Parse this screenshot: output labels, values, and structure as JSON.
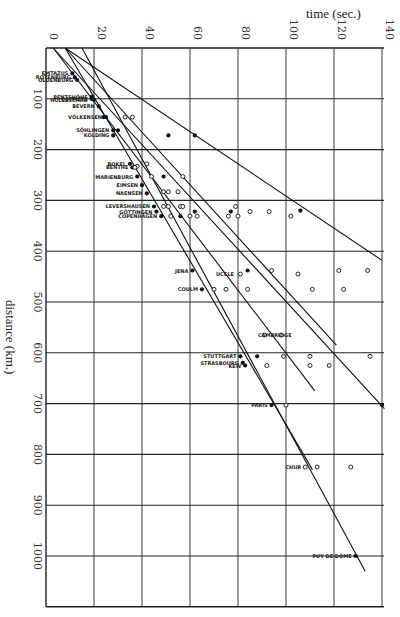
{
  "chart_data": {
    "type": "scatter",
    "title": "time (sec.)",
    "xlabel": "time (sec.)",
    "ylabel": "distance (km.)",
    "xlim": [
      0,
      140
    ],
    "ylim": [
      0,
      1100
    ],
    "x_axis_position": "top",
    "y_axis_inverted": true,
    "grid": true,
    "x_ticks": [
      "0",
      "20",
      "40",
      "60",
      "80",
      "100",
      "120",
      "140"
    ],
    "y_ticks": [
      "100",
      "200",
      "300",
      "400",
      "500",
      "600",
      "700",
      "800",
      "900",
      "1000"
    ],
    "legend": [
      {
        "marker": "filled-circle",
        "meaning": "station reading (solid dot)"
      },
      {
        "marker": "open-circle",
        "meaning": "station reading (open circle)"
      }
    ],
    "stations": [
      {
        "name": "EMTAZUS",
        "time": 11,
        "distance": 50
      },
      {
        "name": "ROTENBURG",
        "time": 12,
        "distance": 58
      },
      {
        "name": "OLDENBURG",
        "time": 13,
        "distance": 63
      },
      {
        "name": "BENTSHÖHE",
        "time": 19,
        "distance": 96
      },
      {
        "name": "OSTMETE",
        "time": 19,
        "distance": 100
      },
      {
        "name": "HOLLESCHAU",
        "time": 19,
        "distance": 102
      },
      {
        "name": "BEVERN",
        "time": 22,
        "distance": 115
      },
      {
        "name": "VÖLKENSEN",
        "time": 25,
        "distance": 136
      },
      {
        "name": "SÖHLINGEN",
        "time": 28,
        "distance": 162
      },
      {
        "name": "KOLDING",
        "time": 28,
        "distance": 172
      },
      {
        "name": "BOKEL",
        "time": 35,
        "distance": 228
      },
      {
        "name": "BENTHE",
        "time": 36,
        "distance": 235
      },
      {
        "name": "MARIENBURG",
        "time": 38,
        "distance": 253
      },
      {
        "name": "EIMSEN",
        "time": 40,
        "distance": 270
      },
      {
        "name": "NAENSEN",
        "time": 42,
        "distance": 286
      },
      {
        "name": "LEVERSHAUSEN",
        "time": 45,
        "distance": 312
      },
      {
        "name": "GÖTTINGEN",
        "time": 46,
        "distance": 322
      },
      {
        "name": "COPENHAGEN",
        "time": 48,
        "distance": 331
      },
      {
        "name": "JENA",
        "time": 61,
        "distance": 438
      },
      {
        "name": "UCCLE",
        "time": 80,
        "distance": 445
      },
      {
        "name": "COULM",
        "time": 65,
        "distance": 475
      },
      {
        "name": "CAMBRIDGE",
        "time": 104,
        "distance": 565
      },
      {
        "name": "STUTTGART",
        "time": 81,
        "distance": 607
      },
      {
        "name": "STRASBOURG",
        "time": 82,
        "distance": 620
      },
      {
        "name": "KEW",
        "time": 83,
        "distance": 625
      },
      {
        "name": "PARIS",
        "time": 94,
        "distance": 703
      },
      {
        "name": "CHUR",
        "time": 108,
        "distance": 825
      },
      {
        "name": "PUY DE DÔME",
        "time": 129,
        "distance": 1000
      }
    ],
    "filled_points": [
      [
        11,
        50
      ],
      [
        12,
        58
      ],
      [
        13,
        63
      ],
      [
        19,
        96
      ],
      [
        19,
        100
      ],
      [
        20,
        102
      ],
      [
        22,
        115
      ],
      [
        24,
        136
      ],
      [
        25,
        136
      ],
      [
        28,
        162
      ],
      [
        30,
        162
      ],
      [
        28,
        172
      ],
      [
        51,
        172
      ],
      [
        62,
        172
      ],
      [
        35,
        228
      ],
      [
        36,
        235
      ],
      [
        38,
        253
      ],
      [
        49,
        253
      ],
      [
        40,
        270
      ],
      [
        42,
        286
      ],
      [
        45,
        312
      ],
      [
        46,
        322
      ],
      [
        48,
        331
      ],
      [
        56,
        331
      ],
      [
        62,
        322
      ],
      [
        77,
        322
      ],
      [
        106,
        320
      ],
      [
        61,
        438
      ],
      [
        84,
        438
      ],
      [
        65,
        475
      ],
      [
        81,
        607
      ],
      [
        88,
        607
      ],
      [
        82,
        620
      ],
      [
        83,
        625
      ],
      [
        94,
        703
      ],
      [
        140,
        703
      ],
      [
        129,
        1000
      ]
    ],
    "open_points": [
      [
        33,
        136
      ],
      [
        36,
        136
      ],
      [
        38,
        233
      ],
      [
        42,
        228
      ],
      [
        37,
        235
      ],
      [
        44,
        253
      ],
      [
        57,
        253
      ],
      [
        49,
        283
      ],
      [
        51,
        283
      ],
      [
        55,
        283
      ],
      [
        49,
        312
      ],
      [
        51,
        312
      ],
      [
        56,
        312
      ],
      [
        57,
        312
      ],
      [
        52,
        331
      ],
      [
        60,
        331
      ],
      [
        63,
        331
      ],
      [
        79,
        312
      ],
      [
        76,
        331
      ],
      [
        80,
        331
      ],
      [
        85,
        322
      ],
      [
        93,
        322
      ],
      [
        102,
        331
      ],
      [
        81,
        445
      ],
      [
        94,
        438
      ],
      [
        105,
        445
      ],
      [
        122,
        438
      ],
      [
        134,
        438
      ],
      [
        70,
        475
      ],
      [
        75,
        475
      ],
      [
        84,
        475
      ],
      [
        111,
        475
      ],
      [
        124,
        475
      ],
      [
        91,
        565
      ],
      [
        98,
        565
      ],
      [
        99,
        607
      ],
      [
        110,
        607
      ],
      [
        135,
        607
      ],
      [
        92,
        625
      ],
      [
        110,
        625
      ],
      [
        118,
        625
      ],
      [
        100,
        703
      ],
      [
        108,
        825
      ],
      [
        113,
        825
      ],
      [
        127,
        825
      ]
    ],
    "lines": [
      {
        "x": [
          8,
          140
        ],
        "y": [
          0,
          418
        ]
      },
      {
        "x": [
          8,
          121
        ],
        "y": [
          0,
          585
        ]
      },
      {
        "x": [
          3,
          141
        ],
        "y": [
          0,
          710
        ]
      },
      {
        "x": [
          3,
          112
        ],
        "y": [
          0,
          675
        ]
      },
      {
        "x": [
          8,
          111
        ],
        "y": [
          0,
          830
        ]
      },
      {
        "x": [
          15,
          133
        ],
        "y": [
          0,
          1030
        ]
      }
    ]
  },
  "labels": {
    "title": "time (sec.)",
    "ylabel": "distance (km.)"
  }
}
